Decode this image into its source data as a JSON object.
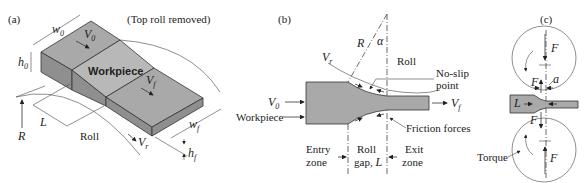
{
  "panel_a": {
    "label": "(a)",
    "note": "(Top roll removed)",
    "workpiece": "Workpiece",
    "w0": "w",
    "w0_sub": "0",
    "h0": "h",
    "h0_sub": "0",
    "V0": "V",
    "V0_sub": "0",
    "Vf": "V",
    "Vf_sub": "f",
    "wf": "w",
    "wf_sub": "f",
    "hf": "h",
    "hf_sub": "f",
    "Vr": "V",
    "Vr_sub": "r",
    "L": "L",
    "R": "R",
    "roll": "Roll"
  },
  "panel_b": {
    "label": "(b)",
    "R": "R",
    "alpha": "α",
    "Vr": "V",
    "Vr_sub": "r",
    "roll": "Roll",
    "no_slip_1": "No-slip",
    "no_slip_2": "point",
    "V0": "V",
    "V0_sub": "0",
    "Vf": "V",
    "Vf_sub": "f",
    "workpiece": "Workpiece",
    "friction": "Friction forces",
    "entry_1": "Entry",
    "entry_2": "zone",
    "gap_1": "Roll",
    "gap_2": "gap, ",
    "gap_L": "L",
    "exit_1": "Exit",
    "exit_2": "zone"
  },
  "panel_c": {
    "label": "(c)",
    "F_top": "F",
    "F_left": "F",
    "a": "a",
    "L": "L",
    "F_lower_left": "F",
    "F_bottom": "F",
    "torque": "Torque"
  }
}
